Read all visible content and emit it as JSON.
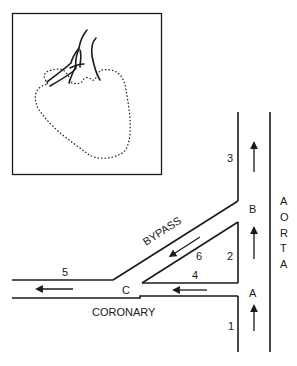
{
  "diagram": {
    "inset": {
      "label": "heart-outline-inset"
    },
    "labels": {
      "n1": "1",
      "n2": "2",
      "n3": "3",
      "n4": "4",
      "n5": "5",
      "n6": "6",
      "A": "A",
      "B": "B",
      "C": "C",
      "bypass": "BYPASS",
      "coronary": "CORONARY",
      "aorta_letters": [
        "A",
        "O",
        "R",
        "T",
        "A"
      ]
    },
    "colors": {
      "line": "#1a1a1a",
      "background": "#ffffff"
    }
  }
}
